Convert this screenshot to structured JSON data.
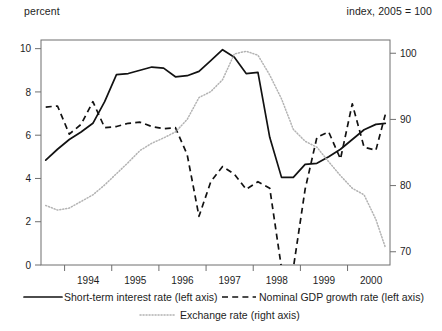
{
  "header": {
    "left_label": "percent",
    "right_label": "index, 2005 = 100"
  },
  "legend": {
    "items": [
      {
        "label": "Short-term interest  rate (left axis)",
        "style": "solid",
        "color": "#121212"
      },
      {
        "label": "Nominal GDP growth rate  (left axis)",
        "style": "dashed",
        "color": "#121212"
      },
      {
        "label": "Exchange rate (right axis)",
        "style": "dotted",
        "color": "#b3b3b3"
      }
    ]
  },
  "chart_data": {
    "type": "line",
    "title": "",
    "xlabel": "",
    "ylabel": "percent",
    "y2label": "index, 2005 = 100",
    "grid": false,
    "legend_position": "bottom",
    "xlim": [
      1993.5,
      2000.9
    ],
    "ylim": [
      0,
      10.4
    ],
    "y2lim": [
      68.0,
      102.0
    ],
    "xtick_values": [
      1994,
      1995,
      1996,
      1997,
      1998,
      1999,
      2000,
      2001
    ],
    "xtick_labels": [
      "1994",
      "1995",
      "1996",
      "1997",
      "1998",
      "1999",
      "2000"
    ],
    "ytick_values": [
      0,
      2,
      4,
      6,
      8,
      10
    ],
    "ytick_labels": [
      "0",
      "2",
      "4",
      "6",
      "8",
      "10"
    ],
    "y2tick_values": [
      70,
      80,
      90,
      100
    ],
    "y2tick_labels": [
      "70",
      "80",
      "90",
      "100"
    ],
    "series": [
      {
        "name": "Short-term interest  rate (left axis)",
        "axis": "left",
        "style": "solid",
        "color": "#121212",
        "x": [
          1993.6,
          1993.85,
          1994.1,
          1994.35,
          1994.6,
          1994.85,
          1995.1,
          1995.35,
          1995.6,
          1995.85,
          1996.1,
          1996.35,
          1996.6,
          1996.85,
          1997.1,
          1997.35,
          1997.6,
          1997.85,
          1998.1,
          1998.35,
          1998.6,
          1998.85,
          1999.1,
          1999.35,
          1999.6,
          1999.85,
          2000.1,
          2000.35,
          2000.6,
          2000.8
        ],
        "y": [
          4.85,
          5.35,
          5.8,
          6.15,
          6.55,
          7.55,
          8.8,
          8.85,
          9.0,
          9.15,
          9.1,
          8.7,
          8.75,
          8.95,
          9.45,
          9.95,
          9.6,
          8.85,
          8.9,
          5.9,
          4.05,
          4.05,
          4.65,
          4.7,
          5.0,
          5.35,
          5.8,
          6.25,
          6.5,
          6.55
        ]
      },
      {
        "name": "Nominal GDP growth rate  (left axis)",
        "axis": "left",
        "style": "dashed",
        "color": "#121212",
        "x": [
          1993.6,
          1993.85,
          1994.1,
          1994.35,
          1994.6,
          1994.85,
          1995.1,
          1995.35,
          1995.6,
          1995.85,
          1996.1,
          1996.35,
          1996.6,
          1996.85,
          1997.1,
          1997.35,
          1997.6,
          1997.85,
          1998.1,
          1998.35,
          1998.6,
          1998.85,
          1999.1,
          1999.35,
          1999.6,
          1999.85,
          2000.1,
          2000.35,
          2000.6,
          2000.8
        ],
        "y": [
          7.3,
          7.35,
          6.05,
          6.5,
          7.55,
          6.35,
          6.4,
          6.55,
          6.6,
          6.4,
          6.3,
          6.35,
          5.1,
          2.25,
          3.85,
          4.55,
          4.2,
          3.5,
          3.85,
          3.55,
          -0.15,
          -0.15,
          3.5,
          5.9,
          6.15,
          4.9,
          7.45,
          5.45,
          5.3,
          6.95
        ]
      },
      {
        "name": "Exchange rate (right axis)",
        "axis": "right",
        "style": "dotted",
        "color": "#b3b3b3",
        "x": [
          1993.6,
          1993.85,
          1994.1,
          1994.35,
          1994.6,
          1994.85,
          1995.1,
          1995.35,
          1995.6,
          1995.85,
          1996.1,
          1996.35,
          1996.6,
          1996.85,
          1997.1,
          1997.35,
          1997.6,
          1997.85,
          1998.1,
          1998.35,
          1998.6,
          1998.85,
          1999.1,
          1999.35,
          1999.6,
          1999.85,
          2000.1,
          2000.35,
          2000.6,
          2000.8
        ],
        "y": [
          77.0,
          76.3,
          76.6,
          77.6,
          78.6,
          80.1,
          81.8,
          83.5,
          85.3,
          86.4,
          87.2,
          88.1,
          90.0,
          93.3,
          94.2,
          96.0,
          99.9,
          100.3,
          99.7,
          96.7,
          93.1,
          88.5,
          86.7,
          85.8,
          83.6,
          81.5,
          79.6,
          78.6,
          74.9,
          70.7
        ]
      }
    ]
  }
}
